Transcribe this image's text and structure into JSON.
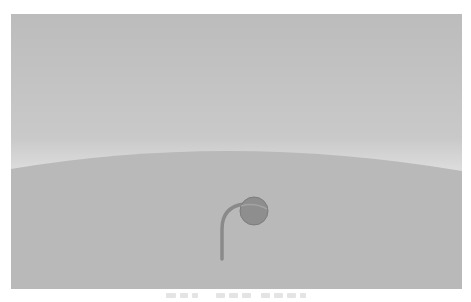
{
  "scene": {
    "description": "Minimal grayscale illustration: pale sky fading to a light horizon, a gently curved gray hill, and a small sprout with a drooping round bud",
    "colors": {
      "sky_top": "#bdbdbd",
      "sky_bottom": "#e6e6e6",
      "ground": "#b9b9b9",
      "stem": "#8a8a8a",
      "bud": "#8e8e8e",
      "bud_highlight": "#a3a3a3",
      "caption_glyphs": "#e4e4e4"
    },
    "horizon": {
      "left_y": 155,
      "peak_x": 220,
      "peak_y": 135,
      "right_y": 156
    },
    "sprout": {
      "stem_base": [
        211,
        245
      ],
      "bud_center": [
        243,
        197
      ],
      "bud_radius": 14
    }
  },
  "caption": {
    "text": "",
    "legible": false
  }
}
